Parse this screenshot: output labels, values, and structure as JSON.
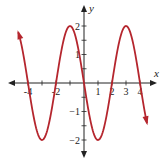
{
  "chart_data": {
    "type": "line",
    "title": "",
    "xlabel": "x",
    "ylabel": "y",
    "xlim": [
      -5,
      5
    ],
    "ylim": [
      -2.4,
      2.5
    ],
    "grid": false,
    "x_ticks": [
      -4,
      -3,
      -2,
      -1,
      1,
      2,
      3,
      4
    ],
    "x_tick_labels": [
      {
        "value": -4,
        "label": "-4"
      },
      {
        "value": -2,
        "label": "-2"
      },
      {
        "value": 1,
        "label": "1"
      },
      {
        "value": 2,
        "label": "2"
      },
      {
        "value": 3,
        "label": "3"
      },
      {
        "value": 4,
        "label": "4"
      }
    ],
    "y_ticks": [
      -2,
      -1.5,
      -1,
      -0.5,
      0.5,
      1,
      1.5,
      2
    ],
    "y_tick_labels": [
      {
        "value": 2,
        "label": "2"
      },
      {
        "value": 1,
        "label": "1"
      },
      {
        "value": -1,
        "label": "−1"
      },
      {
        "value": -2,
        "label": "−2"
      }
    ],
    "series": [
      {
        "name": "y = -2 sin(πx/2)",
        "color": "#b5262e",
        "x_start": -4.7,
        "x_end": 4.5,
        "points": [
          {
            "x": -4.7,
            "y": 1.78
          },
          {
            "x": -4,
            "y": 0
          },
          {
            "x": -3,
            "y": -2
          },
          {
            "x": -2,
            "y": 0
          },
          {
            "x": -1,
            "y": 2
          },
          {
            "x": 0,
            "y": 0
          },
          {
            "x": 1,
            "y": -2
          },
          {
            "x": 2,
            "y": 0
          },
          {
            "x": 3,
            "y": 2
          },
          {
            "x": 4,
            "y": 0
          },
          {
            "x": 4.5,
            "y": -1.41
          }
        ],
        "arrows": "both ends"
      }
    ],
    "axis_color": "#222222"
  }
}
